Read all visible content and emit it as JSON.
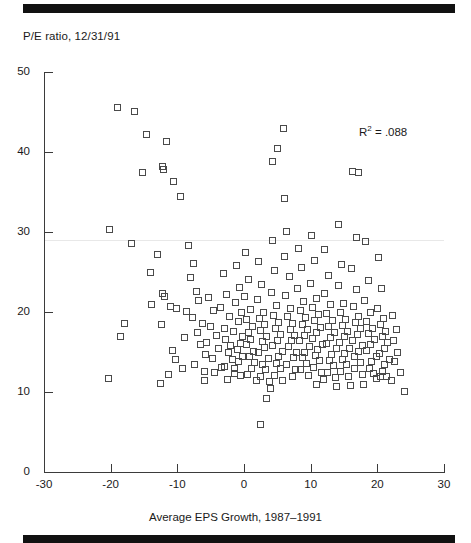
{
  "figure": {
    "y_axis_title": "P/E ratio, 12/31/91",
    "x_axis_title": "Average EPS Growth, 1987–1991",
    "annotation": "R",
    "annotation_sup": "2",
    "annotation_value": "=  .088",
    "rule_color": "#111111",
    "marker_color": "#4a4a4a",
    "axis_color": "#3b3b3b"
  },
  "chart_data": {
    "type": "scatter",
    "title": "",
    "xlabel": "Average EPS Growth, 1987–1991",
    "ylabel": "P/E ratio, 12/31/91",
    "xlim": [
      -30,
      30
    ],
    "ylim": [
      0,
      50
    ],
    "xticks": [
      -30,
      -20,
      -10,
      0,
      10,
      20,
      30
    ],
    "yticks": [
      0,
      10,
      20,
      30,
      40,
      50
    ],
    "grid": false,
    "legend": null,
    "annotations": [
      {
        "text": "R² = .088",
        "x": 17.5,
        "y": 42.5,
        "r_squared": 0.088
      }
    ],
    "marker": "open-square",
    "series": [
      {
        "name": "Companies",
        "n": 252,
        "points": [
          [
            -19.0,
            45.6
          ],
          [
            -16.4,
            45.1
          ],
          [
            -14.6,
            42.2
          ],
          [
            -11.6,
            41.3
          ],
          [
            -12.3,
            38.2
          ],
          [
            -12.1,
            37.8
          ],
          [
            -15.3,
            37.5
          ],
          [
            -10.6,
            36.3
          ],
          [
            -9.6,
            34.4
          ],
          [
            -20.2,
            30.3
          ],
          [
            -16.9,
            28.6
          ],
          [
            -13.0,
            27.2
          ],
          [
            -14.0,
            24.9
          ],
          [
            -12.2,
            22.3
          ],
          [
            -11.9,
            22.0
          ],
          [
            -13.9,
            21.0
          ],
          [
            -11.0,
            20.7
          ],
          [
            -10.1,
            20.4
          ],
          [
            -12.4,
            18.5
          ],
          [
            -17.9,
            18.6
          ],
          [
            -18.5,
            16.9
          ],
          [
            -10.7,
            15.2
          ],
          [
            -10.3,
            14.1
          ],
          [
            -9.2,
            13.0
          ],
          [
            -11.4,
            12.2
          ],
          [
            -20.3,
            11.7
          ],
          [
            -12.6,
            11.1
          ],
          [
            -8.4,
            28.3
          ],
          [
            -7.6,
            26.1
          ],
          [
            -8.1,
            24.3
          ],
          [
            -7.2,
            22.6
          ],
          [
            -6.9,
            21.4
          ],
          [
            -8.6,
            20.1
          ],
          [
            -7.8,
            19.3
          ],
          [
            -6.3,
            18.6
          ],
          [
            -7.0,
            17.5
          ],
          [
            -8.9,
            16.8
          ],
          [
            -6.6,
            15.9
          ],
          [
            -5.8,
            14.7
          ],
          [
            -7.4,
            13.4
          ],
          [
            -6.0,
            12.6
          ],
          [
            -5.3,
            21.8
          ],
          [
            -4.6,
            20.2
          ],
          [
            -5.0,
            18.2
          ],
          [
            -4.2,
            17.1
          ],
          [
            -5.6,
            16.2
          ],
          [
            -3.9,
            15.4
          ],
          [
            -4.8,
            14.2
          ],
          [
            -3.4,
            13.1
          ],
          [
            -4.4,
            12.4
          ],
          [
            -5.9,
            11.4
          ],
          [
            -3.1,
            24.8
          ],
          [
            -2.6,
            22.2
          ],
          [
            -3.6,
            20.6
          ],
          [
            -2.2,
            19.4
          ],
          [
            -3.0,
            18.0
          ],
          [
            -2.8,
            16.6
          ],
          [
            -2.0,
            15.8
          ],
          [
            -2.4,
            14.9
          ],
          [
            -1.8,
            14.1
          ],
          [
            -2.9,
            13.2
          ],
          [
            -1.5,
            12.3
          ],
          [
            -2.5,
            11.6
          ],
          [
            -1.1,
            25.8
          ],
          [
            -0.7,
            23.1
          ],
          [
            -1.3,
            21.2
          ],
          [
            -0.4,
            19.9
          ],
          [
            -0.9,
            18.8
          ],
          [
            -1.6,
            17.6
          ],
          [
            -0.2,
            16.9
          ],
          [
            -0.6,
            16.1
          ],
          [
            -1.0,
            15.3
          ],
          [
            -0.3,
            14.5
          ],
          [
            -0.8,
            13.8
          ],
          [
            -1.4,
            13.0
          ],
          [
            -0.5,
            12.1
          ],
          [
            0.2,
            27.4
          ],
          [
            0.6,
            24.1
          ],
          [
            0.1,
            22.0
          ],
          [
            0.9,
            20.3
          ],
          [
            0.4,
            19.1
          ],
          [
            1.2,
            18.2
          ],
          [
            0.7,
            17.4
          ],
          [
            1.0,
            16.6
          ],
          [
            0.3,
            15.9
          ],
          [
            1.4,
            15.1
          ],
          [
            0.8,
            14.4
          ],
          [
            1.6,
            13.7
          ],
          [
            1.1,
            12.9
          ],
          [
            0.5,
            12.2
          ],
          [
            1.8,
            11.5
          ],
          [
            2.1,
            26.3
          ],
          [
            2.6,
            23.4
          ],
          [
            2.0,
            21.6
          ],
          [
            2.9,
            20.0
          ],
          [
            2.3,
            19.2
          ],
          [
            3.1,
            18.4
          ],
          [
            2.5,
            17.7
          ],
          [
            3.4,
            17.0
          ],
          [
            2.8,
            16.3
          ],
          [
            3.0,
            15.6
          ],
          [
            2.2,
            14.9
          ],
          [
            3.6,
            14.2
          ],
          [
            2.7,
            13.5
          ],
          [
            3.2,
            12.8
          ],
          [
            2.4,
            12.0
          ],
          [
            3.8,
            11.3
          ],
          [
            2.4,
            6.0
          ],
          [
            3.3,
            9.2
          ],
          [
            4.0,
            10.4
          ],
          [
            4.2,
            29.0
          ],
          [
            4.6,
            25.2
          ],
          [
            4.1,
            22.4
          ],
          [
            4.9,
            20.8
          ],
          [
            4.4,
            19.6
          ],
          [
            5.2,
            18.7
          ],
          [
            4.7,
            17.9
          ],
          [
            5.5,
            17.2
          ],
          [
            5.0,
            16.5
          ],
          [
            4.3,
            15.8
          ],
          [
            5.8,
            15.1
          ],
          [
            5.1,
            14.4
          ],
          [
            4.8,
            13.6
          ],
          [
            5.4,
            12.9
          ],
          [
            4.5,
            12.1
          ],
          [
            5.7,
            11.4
          ],
          [
            5.9,
            43.0
          ],
          [
            5.0,
            40.5
          ],
          [
            4.2,
            38.8
          ],
          [
            6.1,
            34.2
          ],
          [
            6.4,
            30.1
          ],
          [
            6.0,
            27.0
          ],
          [
            6.8,
            24.5
          ],
          [
            6.2,
            22.1
          ],
          [
            7.0,
            20.5
          ],
          [
            6.5,
            19.4
          ],
          [
            7.3,
            18.6
          ],
          [
            6.9,
            17.8
          ],
          [
            7.6,
            17.1
          ],
          [
            7.1,
            16.4
          ],
          [
            6.6,
            15.7
          ],
          [
            7.9,
            15.0
          ],
          [
            7.4,
            14.3
          ],
          [
            6.3,
            13.5
          ],
          [
            7.7,
            12.8
          ],
          [
            7.2,
            12.0
          ],
          [
            8.2,
            28.0
          ],
          [
            8.6,
            25.6
          ],
          [
            8.0,
            23.0
          ],
          [
            8.9,
            21.3
          ],
          [
            8.4,
            20.2
          ],
          [
            9.2,
            19.3
          ],
          [
            8.7,
            18.5
          ],
          [
            9.5,
            17.8
          ],
          [
            9.0,
            17.1
          ],
          [
            8.3,
            16.4
          ],
          [
            9.8,
            15.7
          ],
          [
            9.1,
            15.0
          ],
          [
            8.8,
            14.3
          ],
          [
            9.4,
            13.6
          ],
          [
            8.5,
            12.8
          ],
          [
            9.7,
            12.1
          ],
          [
            10.1,
            29.6
          ],
          [
            10.5,
            26.4
          ],
          [
            10.0,
            23.6
          ],
          [
            10.8,
            21.7
          ],
          [
            10.3,
            20.6
          ],
          [
            11.1,
            19.7
          ],
          [
            10.6,
            18.9
          ],
          [
            11.4,
            18.1
          ],
          [
            10.9,
            17.4
          ],
          [
            10.2,
            16.7
          ],
          [
            11.7,
            16.0
          ],
          [
            11.0,
            15.3
          ],
          [
            10.7,
            14.6
          ],
          [
            11.3,
            13.9
          ],
          [
            10.4,
            13.1
          ],
          [
            11.6,
            12.4
          ],
          [
            11.9,
            11.6
          ],
          [
            10.8,
            10.9
          ],
          [
            12.1,
            27.8
          ],
          [
            12.6,
            24.6
          ],
          [
            12.0,
            22.3
          ],
          [
            12.9,
            20.9
          ],
          [
            12.4,
            19.8
          ],
          [
            13.2,
            19.0
          ],
          [
            12.7,
            18.2
          ],
          [
            13.5,
            17.5
          ],
          [
            13.0,
            16.8
          ],
          [
            12.3,
            16.1
          ],
          [
            13.8,
            15.4
          ],
          [
            13.1,
            14.7
          ],
          [
            12.8,
            14.0
          ],
          [
            13.4,
            13.3
          ],
          [
            12.5,
            12.5
          ],
          [
            13.7,
            11.8
          ],
          [
            13.9,
            10.7
          ],
          [
            14.2,
            31.0
          ],
          [
            14.6,
            26.0
          ],
          [
            14.1,
            23.3
          ],
          [
            14.9,
            21.1
          ],
          [
            14.4,
            20.0
          ],
          [
            15.2,
            19.1
          ],
          [
            14.7,
            18.3
          ],
          [
            15.5,
            17.6
          ],
          [
            15.0,
            16.9
          ],
          [
            14.3,
            16.2
          ],
          [
            15.8,
            15.5
          ],
          [
            15.1,
            14.8
          ],
          [
            14.8,
            14.1
          ],
          [
            15.4,
            13.4
          ],
          [
            14.5,
            12.6
          ],
          [
            15.7,
            11.9
          ],
          [
            15.9,
            10.8
          ],
          [
            16.2,
            37.6
          ],
          [
            17.1,
            37.4
          ],
          [
            16.8,
            29.3
          ],
          [
            16.1,
            25.4
          ],
          [
            16.9,
            22.8
          ],
          [
            16.4,
            20.7
          ],
          [
            17.2,
            19.5
          ],
          [
            16.7,
            18.7
          ],
          [
            17.5,
            17.9
          ],
          [
            17.0,
            17.2
          ],
          [
            16.3,
            16.5
          ],
          [
            17.8,
            15.8
          ],
          [
            17.1,
            15.1
          ],
          [
            16.6,
            14.4
          ],
          [
            17.4,
            13.7
          ],
          [
            16.5,
            12.9
          ],
          [
            17.7,
            12.2
          ],
          [
            17.9,
            11.0
          ],
          [
            18.2,
            28.8
          ],
          [
            18.6,
            24.0
          ],
          [
            18.1,
            21.5
          ],
          [
            18.9,
            19.9
          ],
          [
            18.4,
            18.8
          ],
          [
            19.2,
            18.0
          ],
          [
            18.7,
            17.3
          ],
          [
            19.5,
            16.6
          ],
          [
            19.0,
            15.9
          ],
          [
            18.3,
            15.2
          ],
          [
            19.8,
            14.5
          ],
          [
            19.1,
            13.8
          ],
          [
            18.8,
            13.0
          ],
          [
            19.4,
            12.3
          ],
          [
            19.9,
            11.7
          ],
          [
            20.1,
            26.8
          ],
          [
            20.6,
            22.9
          ],
          [
            20.0,
            20.4
          ],
          [
            20.9,
            19.2
          ],
          [
            20.4,
            18.4
          ],
          [
            21.2,
            17.6
          ],
          [
            20.7,
            16.9
          ],
          [
            21.5,
            16.2
          ],
          [
            21.0,
            15.5
          ],
          [
            20.3,
            14.8
          ],
          [
            21.8,
            14.1
          ],
          [
            21.1,
            13.4
          ],
          [
            20.8,
            12.6
          ],
          [
            21.4,
            11.9
          ],
          [
            20.5,
            12.0
          ],
          [
            22.2,
            19.6
          ],
          [
            22.8,
            17.8
          ],
          [
            22.4,
            16.4
          ],
          [
            23.0,
            15.0
          ],
          [
            22.6,
            13.8
          ],
          [
            23.4,
            12.4
          ],
          [
            22.1,
            11.4
          ],
          [
            24.0,
            10.1
          ]
        ]
      }
    ]
  }
}
